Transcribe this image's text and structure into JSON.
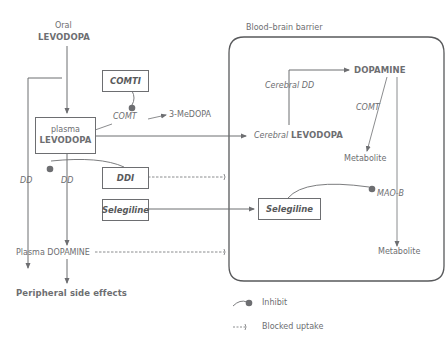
{
  "diagram": {
    "barrier_label": "Blood–brain barrier",
    "nodes": {
      "oral_top": "Oral",
      "oral_bottom": "LEVODOPA",
      "plasma_top": "plasma",
      "plasma_bottom": "LEVODOPA",
      "comti": "COMTI",
      "comt_peripheral": "COMT",
      "three_medopa": "3-MeDOPA",
      "ddi": "DDI",
      "selegiline_outer": "Selegiline",
      "selegiline_inner": "Selegiline",
      "dd_left": "DD",
      "dd_right": "DD",
      "plasma_dopamine": "Plasma DOPAMINE",
      "peripheral_effects": "Peripheral side effects",
      "cerebral_prefix": "Cerebral",
      "cerebral_levodopa": "LEVODOPA",
      "cerebral_dd": "Cerebral DD",
      "dopamine": "DOPAMINE",
      "comt_central": "COMT",
      "metabolite_comt": "Metabolite",
      "mao_b": "MAO-B",
      "metabolite_mao": "Metabolite"
    },
    "legend": {
      "inhibit": "Inhibit",
      "blocked_uptake": "Blocked uptake"
    },
    "colors": {
      "line": "#6d6e71",
      "dot": "#6d6e71",
      "text": "#6d6e71"
    }
  }
}
